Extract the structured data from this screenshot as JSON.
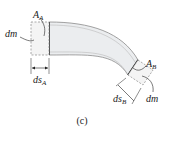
{
  "diagram": {
    "caption": "(c)",
    "labels": {
      "area_a": "A",
      "area_a_sub": "A",
      "mass_a": "dm",
      "ds_a": "ds",
      "ds_a_sub": "A",
      "area_b": "A",
      "area_b_sub": "B",
      "mass_b": "dm",
      "ds_b": "ds",
      "ds_b_sub": "B"
    },
    "colors": {
      "pipe_fill": "#ebedef",
      "pipe_outline": "#6a6a6a",
      "ink": "#222222",
      "dashed": "#777777"
    }
  }
}
